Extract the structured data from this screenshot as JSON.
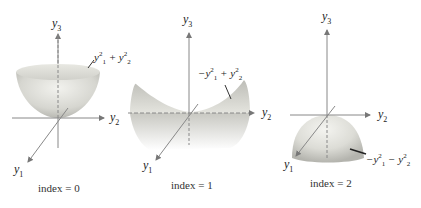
{
  "figure": {
    "panels": [
      {
        "index_label": "index = 0",
        "surface_label": {
          "sign1": "",
          "op": "+",
          "text": "y1^2 + y2^2"
        },
        "axes": {
          "y1": "y",
          "y1_sub": "1",
          "y2": "y",
          "y2_sub": "2",
          "y3": "y",
          "y3_sub": "3"
        },
        "shape": "upward paraboloid (bowl)"
      },
      {
        "index_label": "index = 1",
        "surface_label": {
          "sign1": "−",
          "op": "+",
          "text": "-y1^2 + y2^2"
        },
        "axes": {
          "y1": "y",
          "y1_sub": "1",
          "y2": "y",
          "y2_sub": "2",
          "y3": "y",
          "y3_sub": "3"
        },
        "shape": "saddle"
      },
      {
        "index_label": "index = 2",
        "surface_label": {
          "sign1": "−",
          "op": "−",
          "text": "-y1^2 - y2^2"
        },
        "axes": {
          "y1": "y",
          "y1_sub": "1",
          "y2": "y",
          "y2_sub": "2",
          "y3": "y",
          "y3_sub": "3"
        },
        "shape": "downward paraboloid (dome)"
      }
    ],
    "eq_parts": {
      "y": "y",
      "sup": "2",
      "sub1": "1",
      "sub2": "2"
    }
  }
}
